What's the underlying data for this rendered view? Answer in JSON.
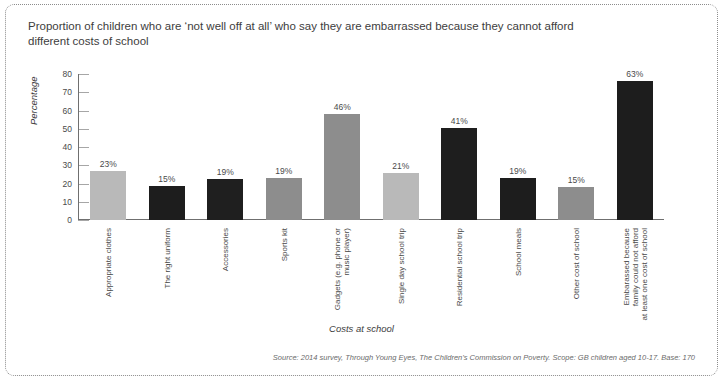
{
  "title": "Proportion of children who are ‘not well off at all’ who say they are embarrassed because they cannot afford different costs of school",
  "source": "Source: 2014 survey, Through Young Eyes, The Children’s Commission on Poverty. Scope: GB children aged 10-17. Base: 170",
  "chart_data": {
    "type": "bar",
    "title": "Proportion of children who are ‘not well off at all’ who say they are embarrassed because they cannot afford different costs of school",
    "xlabel": "Costs at school",
    "ylabel": "Percentage",
    "ylim": [
      0,
      80
    ],
    "yticks": [
      0,
      10,
      20,
      30,
      40,
      50,
      60,
      70,
      80
    ],
    "grid": false,
    "legend": "none",
    "categories": [
      "Appropriate clothes",
      "The right uniform",
      "Accessories",
      "Sports kit",
      "Gadgets (e.g. phone or music player)",
      "Single day school trip",
      "Residential school trip",
      "School meals",
      "Other cost of school",
      "Embarassed because family could not afford at least one cost of school"
    ],
    "category_lines": [
      [
        "Appropriate clothes"
      ],
      [
        "The right uniform"
      ],
      [
        "Accessories"
      ],
      [
        "Sports kit"
      ],
      [
        "Gadgets (e.g. phone or",
        "music player)"
      ],
      [
        "Single day school trip"
      ],
      [
        "Residential school trip"
      ],
      [
        "School meals"
      ],
      [
        "Other cost of school"
      ],
      [
        "Embarassed because",
        "family could not afford",
        "at least one cost of school"
      ]
    ],
    "values": [
      23,
      15,
      19,
      19,
      46,
      21,
      41,
      19,
      15,
      63
    ],
    "value_labels": [
      "23%",
      "15%",
      "19%",
      "19%",
      "46%",
      "21%",
      "41%",
      "19%",
      "15%",
      "63%"
    ],
    "plotted_heights": [
      27,
      18.5,
      22.5,
      23,
      58,
      25.5,
      50.5,
      23,
      18,
      76
    ],
    "bar_colors": [
      "#b9b9b9",
      "#1d1d1d",
      "#1f1f1f",
      "#8d8d8d",
      "#8d8d8d",
      "#b9b9b9",
      "#1e1e1e",
      "#1d1d1d",
      "#8d8d8d",
      "#1d1d1d"
    ]
  }
}
